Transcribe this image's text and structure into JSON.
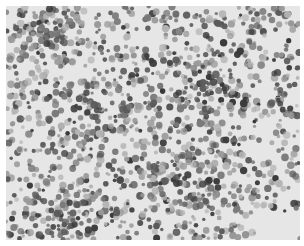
{
  "image": {
    "kind": "grayscale micrograph of densely packed round cells",
    "width": 304,
    "height": 246,
    "content_box": {
      "x": 6,
      "y": 6,
      "w": 294,
      "h": 234
    },
    "background_color": "#e6e6e6",
    "border_color": "#ffffff",
    "cell_tones": [
      "#3a3a3a",
      "#5a5a5a",
      "#7a7a7a",
      "#9a9a9a",
      "#b4b4b4"
    ],
    "dense_regions": [
      {
        "cx": 40,
        "cy": 30,
        "r": 40
      },
      {
        "cx": 100,
        "cy": 100,
        "r": 45
      },
      {
        "cx": 200,
        "cy": 80,
        "r": 40
      },
      {
        "cx": 170,
        "cy": 175,
        "r": 40
      },
      {
        "cx": 60,
        "cy": 210,
        "r": 40
      }
    ],
    "clear_regions": [
      {
        "cx": 270,
        "cy": 225,
        "r": 30
      },
      {
        "cx": 150,
        "cy": 30,
        "r": 12
      },
      {
        "cx": 250,
        "cy": 145,
        "r": 14
      }
    ],
    "cell_count": 1500,
    "seed": 7
  }
}
